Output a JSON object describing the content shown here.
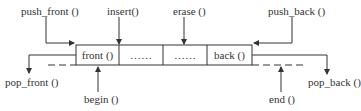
{
  "diagram": {
    "type": "deque-operations",
    "cells": [
      "front ()",
      "……",
      "……",
      "back ()"
    ],
    "top_labels": {
      "push_front": "push_front ()",
      "insert": "insert()",
      "erase": "erase ()",
      "push_back": "push_back ()"
    },
    "side_labels": {
      "pop_front": "pop_front ()",
      "pop_back": "pop_back ()"
    },
    "bottom_labels": {
      "begin": "begin ()",
      "end": "end ()"
    },
    "colors": {
      "line": "#333333",
      "text": "#333333"
    }
  }
}
